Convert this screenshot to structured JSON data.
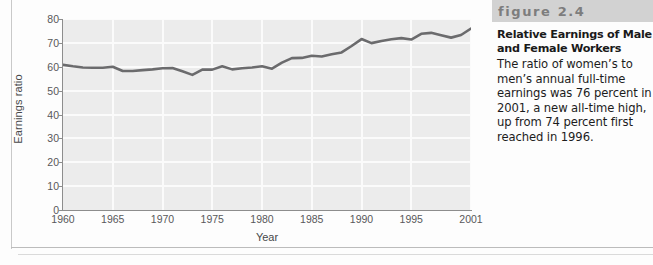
{
  "figure": {
    "band_label": "figure 2.4",
    "title": "Relative Earnings of Male and Female Workers",
    "body": "The ratio of women’s to men’s annual full-time earnings was 76 percent in 2001, a new all-time high, up from 74 percent first reached in 1996."
  },
  "colors": {
    "plot_background": "#ececec",
    "gridline": "#fbfbfb",
    "series_line": "#6b6b6d",
    "axis": "#8d8d8d",
    "tick_text": "#58585a",
    "band_background": "#d2d2d2",
    "band_text": "#7d7d7d"
  },
  "chart_data": {
    "type": "line",
    "title": "",
    "xlabel": "Year",
    "ylabel": "Earnings ratio",
    "xlim": [
      1960,
      2001
    ],
    "ylim": [
      0,
      80
    ],
    "grid": true,
    "legend": "none",
    "ytick_labels": [
      "80",
      "70",
      "60",
      "50",
      "40",
      "30",
      "20",
      "10",
      "0"
    ],
    "ytick_values": [
      80,
      70,
      60,
      50,
      40,
      30,
      20,
      10,
      0
    ],
    "xtick_labels": [
      "1960",
      "1965",
      "1970",
      "1975",
      "1980",
      "1985",
      "1990",
      "1995",
      "2001"
    ],
    "xtick_values": [
      1960,
      1965,
      1970,
      1975,
      1980,
      1985,
      1990,
      1995,
      2001
    ],
    "series": [
      {
        "name": "Earnings ratio",
        "x": [
          1960,
          1961,
          1962,
          1963,
          1964,
          1965,
          1966,
          1967,
          1968,
          1969,
          1970,
          1971,
          1972,
          1973,
          1974,
          1975,
          1976,
          1977,
          1978,
          1979,
          1980,
          1981,
          1982,
          1983,
          1984,
          1985,
          1986,
          1987,
          1988,
          1989,
          1990,
          1991,
          1992,
          1993,
          1994,
          1995,
          1996,
          1997,
          1998,
          1999,
          2000,
          2001
        ],
        "values": [
          60.8,
          60.2,
          59.7,
          59.6,
          59.6,
          60.0,
          58.2,
          58.2,
          58.6,
          58.9,
          59.4,
          59.5,
          58.1,
          56.6,
          58.8,
          58.8,
          60.2,
          58.9,
          59.4,
          59.7,
          60.2,
          59.2,
          61.7,
          63.6,
          63.7,
          64.6,
          64.3,
          65.2,
          66.0,
          68.7,
          71.6,
          69.9,
          70.8,
          71.5,
          72.0,
          71.4,
          73.8,
          74.2,
          73.2,
          72.2,
          73.3,
          76.0
        ]
      }
    ]
  }
}
